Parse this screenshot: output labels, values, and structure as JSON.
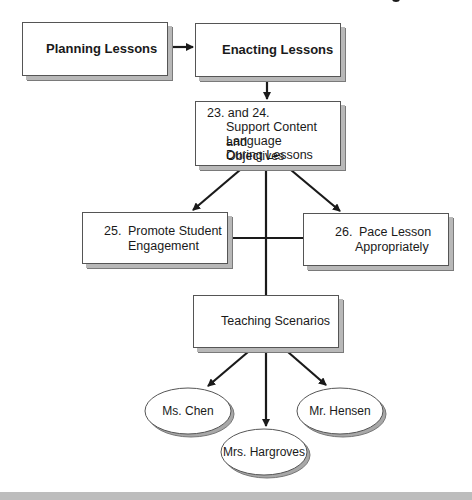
{
  "diagram": {
    "nodes": {
      "planning": {
        "label": "Planning Lessons"
      },
      "enacting": {
        "label": "Enacting Lessons"
      },
      "support": {
        "number": "23. and 24.",
        "lines": [
          "Support Content and",
          "Language Objectives",
          "During Lessons"
        ]
      },
      "engagement": {
        "number": "25.",
        "lines": [
          "Promote Student",
          "Engagement"
        ]
      },
      "pace": {
        "number": "26.",
        "lines": [
          "Pace Lesson",
          "Appropriately"
        ]
      },
      "scenarios": {
        "label": "Teaching Scenarios"
      },
      "chen": {
        "label": "Ms. Chen"
      },
      "hargroves": {
        "label": "Mrs. Hargroves"
      },
      "hensen": {
        "label": "Mr. Hensen"
      }
    },
    "edges": [
      {
        "from": "Planning Lessons",
        "to": "Enacting Lessons"
      },
      {
        "from": "Enacting Lessons",
        "to": "23. and 24. Support Content and Language Objectives During Lessons"
      },
      {
        "from": "23. and 24.",
        "to": "25. Promote Student Engagement"
      },
      {
        "from": "23. and 24.",
        "to": "26. Pace Lesson Appropriately"
      },
      {
        "from": "23. and 24.",
        "to": "Teaching Scenarios"
      },
      {
        "from": "Teaching Scenarios",
        "to": "Ms. Chen"
      },
      {
        "from": "Teaching Scenarios",
        "to": "Mrs. Hargroves"
      },
      {
        "from": "Teaching Scenarios",
        "to": "Mr. Hensen"
      }
    ]
  }
}
